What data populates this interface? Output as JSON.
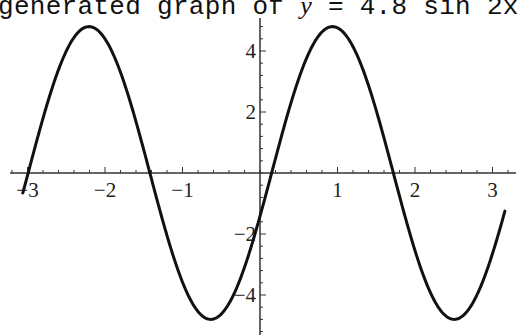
{
  "caption": {
    "prefix": "generated graph of ",
    "var": "y",
    "suffix": " = 4.8 sin 2x"
  },
  "chart_data": {
    "type": "line",
    "title": "generated graph of y = 4.8 sin 2x",
    "xlabel": "",
    "ylabel": "",
    "function": "y = 4.8 sin(2x - 0.3)",
    "amplitude": 4.8,
    "frequency": 2,
    "phase": -0.3,
    "x_range": [
      -3.06,
      3.16
    ],
    "xlim": [
      -3.3,
      3.3
    ],
    "ylim": [
      -5.3,
      5.1
    ],
    "x_ticks": [
      -3,
      -2,
      -1,
      1,
      2,
      3
    ],
    "x_tick_labels": [
      "-3",
      "-2",
      "-1",
      "1",
      "2",
      "3"
    ],
    "y_ticks": [
      -4,
      -2,
      2,
      4
    ],
    "y_tick_labels": [
      "-4",
      "-2",
      "2",
      "4"
    ],
    "minor_tick_step_x": 0.2,
    "minor_tick_step_y": 0.4,
    "grid": false,
    "legend": null,
    "series": [
      {
        "name": "y",
        "sample_points": [
          {
            "x": -3.06,
            "y": -1.5
          },
          {
            "x": -2.2,
            "y": 4.8
          },
          {
            "x": -1.42,
            "y": 0
          },
          {
            "x": -0.64,
            "y": -4.8
          },
          {
            "x": 0,
            "y": -1.42
          },
          {
            "x": 0.15,
            "y": 0
          },
          {
            "x": 0.94,
            "y": 4.8
          },
          {
            "x": 1.72,
            "y": 0
          },
          {
            "x": 2.5,
            "y": -4.8
          },
          {
            "x": 3.16,
            "y": -1.3
          }
        ],
        "color": "#111111"
      }
    ]
  },
  "plot": {
    "origin_px": [
      260,
      173
    ],
    "px_per_unit_x": 77.5,
    "px_per_unit_y": 30.5,
    "x_axis_px": [
      10,
      516
    ],
    "y_axis_px": [
      18,
      335
    ],
    "line_color": "#111111",
    "axis_color": "#333333"
  }
}
